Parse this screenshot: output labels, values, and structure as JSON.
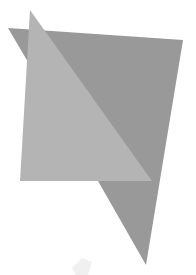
{
  "image": {
    "description": "Two overlapping flat gray geometric shapes",
    "background": "#ffffff",
    "shapes": [
      {
        "name": "dark-quadrilateral",
        "fill": "#999999",
        "points": [
          [
            8,
            28
          ],
          [
            183,
            40
          ],
          [
            146,
            265
          ],
          [
            98,
            181
          ]
        ]
      },
      {
        "name": "light-triangle",
        "fill": "#b4b4b4",
        "points": [
          [
            30,
            10
          ],
          [
            152,
            181
          ],
          [
            20,
            181
          ]
        ]
      }
    ],
    "watermark": {
      "fill": "#f0f0f0",
      "points": [
        [
          72,
          268
        ],
        [
          82,
          258
        ],
        [
          92,
          262
        ],
        [
          88,
          275
        ],
        [
          76,
          275
        ]
      ]
    }
  }
}
